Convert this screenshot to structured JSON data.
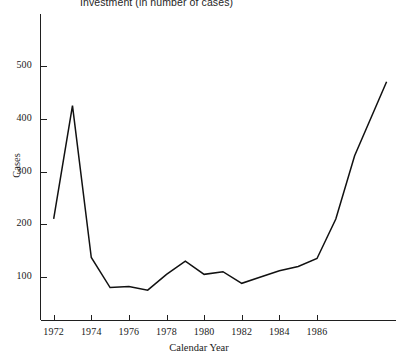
{
  "chart_data": {
    "type": "line",
    "title": "Investment  (in number of cases)",
    "xlabel": "Calendar Year",
    "ylabel": "Cases",
    "grid": false,
    "legend": null,
    "xlim": [
      1971.3,
      1990.2
    ],
    "ylim": [
      0,
      545
    ],
    "xticks": [
      1972,
      1974,
      1976,
      1978,
      1980,
      1982,
      1984,
      1986
    ],
    "xtick_labels": [
      "1972",
      "1974",
      "1976",
      "1978",
      "1980",
      "1982",
      "1984",
      "1986"
    ],
    "yticks": [
      100,
      200,
      300,
      400,
      500
    ],
    "ytick_labels": [
      "100",
      "200",
      "300",
      "400",
      "500"
    ],
    "x": [
      1972,
      1973,
      1974,
      1975,
      1976,
      1977,
      1978,
      1979,
      1980,
      1981,
      1982,
      1983,
      1984,
      1985,
      1986,
      1987,
      1988,
      1989.7
    ],
    "values": [
      210,
      425,
      137,
      80,
      82,
      75,
      105,
      130,
      105,
      110,
      88,
      100,
      112,
      120,
      135,
      210,
      330,
      470
    ],
    "series": [
      {
        "name": "Cases",
        "color": "#111111",
        "values": [
          210,
          425,
          137,
          80,
          82,
          75,
          105,
          130,
          105,
          110,
          88,
          100,
          112,
          120,
          135,
          210,
          330,
          470
        ]
      }
    ]
  },
  "axes": {
    "y_title": "Cases",
    "x_title": "Calendar Year"
  }
}
